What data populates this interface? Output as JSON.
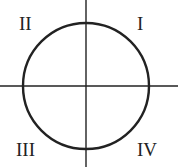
{
  "diagram": {
    "type": "unit-circle-quadrants",
    "stroke_color": "#222222",
    "quadrants": [
      {
        "label": "I",
        "position": "top-right"
      },
      {
        "label": "II",
        "position": "top-left"
      },
      {
        "label": "III",
        "position": "bottom-left"
      },
      {
        "label": "IV",
        "position": "bottom-right"
      }
    ]
  }
}
